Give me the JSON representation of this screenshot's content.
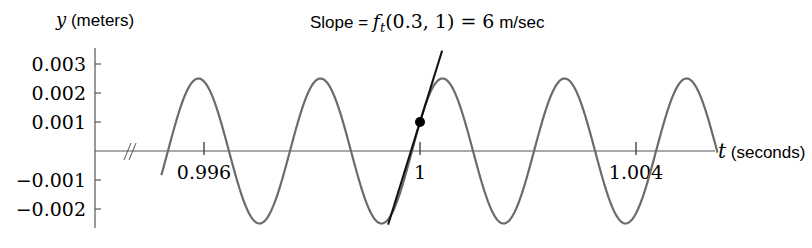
{
  "chart_data": {
    "type": "line",
    "title_parts": {
      "prefix": "Slope = ",
      "func": "f",
      "sub": "t",
      "args": "(0.3, 1) = 6",
      "unit": " m/sec"
    },
    "xlabel": {
      "var": "t",
      "unit": " (seconds)"
    },
    "ylabel": {
      "var": "y",
      "unit": " (meters)"
    },
    "xlim": [
      0.9946,
      1.0053
    ],
    "ylim": [
      -0.0025,
      0.0031
    ],
    "x_ticks": [
      {
        "value": 0.996,
        "label": "0.996"
      },
      {
        "value": 1.0,
        "label": "1"
      },
      {
        "value": 1.004,
        "label": "1.004"
      }
    ],
    "y_ticks": [
      {
        "value": 0.003,
        "label": "0.003"
      },
      {
        "value": 0.002,
        "label": "0.002"
      },
      {
        "value": 0.001,
        "label": "0.001"
      },
      {
        "value": -0.001,
        "label": "−0.001"
      },
      {
        "value": -0.002,
        "label": "−0.002"
      }
    ],
    "series": [
      {
        "name": "y = f(0.3, t)",
        "kind": "sinusoid",
        "amplitude": 0.0025,
        "period": 0.00226,
        "t_start": 0.99521,
        "t_end": 1.00551,
        "color": "#6b6b6b"
      },
      {
        "name": "tangent at t = 1",
        "kind": "line",
        "slope": 6,
        "through": [
          1.0,
          0.001
        ],
        "t_start": 0.99941,
        "t_end": 1.00041,
        "color": "#111111"
      }
    ],
    "points": [
      {
        "t": 1.0,
        "y": 0.001,
        "label": "(1, 0.001)"
      }
    ],
    "axis_break": true,
    "grid": false,
    "legend": null
  }
}
